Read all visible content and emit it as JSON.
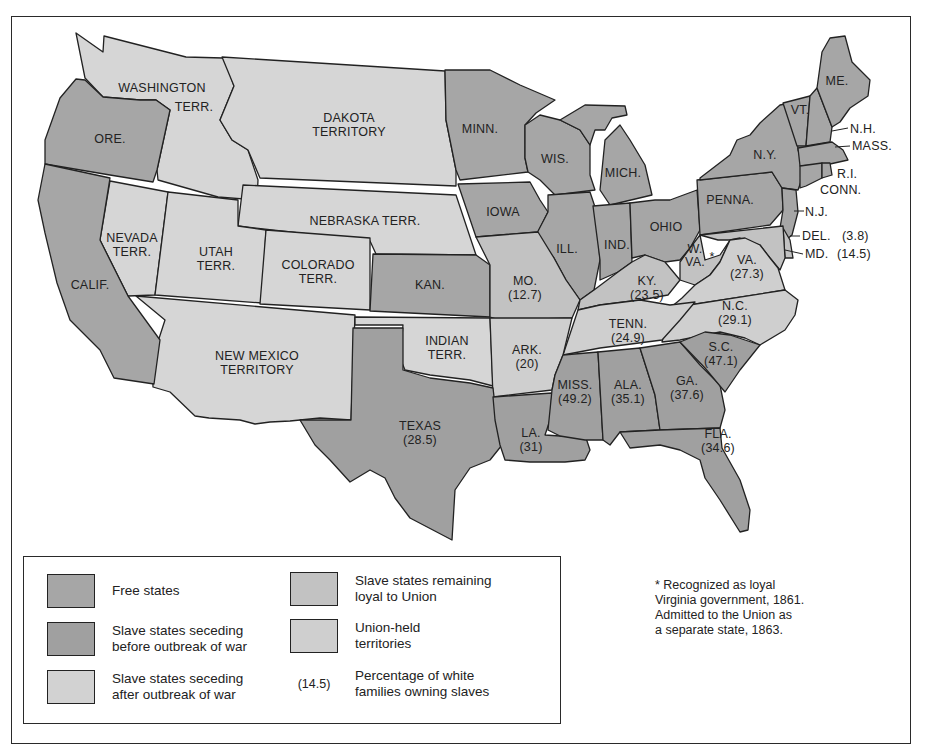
{
  "colors": {
    "free_states": "#a6a6a6",
    "seceding_before": "#a0a0a0",
    "seceding_after": "#cfcfcf",
    "loyal_slave": "#c2c2c2",
    "territories": "#d6d6d6",
    "water": "#ffffff",
    "border": "#222222"
  },
  "map": {
    "regions": [
      {
        "name": "WASHINGTON TERR.",
        "category": "Union-held territories"
      },
      {
        "name": "ORE.",
        "category": "Free states"
      },
      {
        "name": "CALIF.",
        "category": "Free states"
      },
      {
        "name": "NEVADA TERR.",
        "category": "Union-held territories"
      },
      {
        "name": "UTAH TERR.",
        "category": "Union-held territories"
      },
      {
        "name": "COLORADO TERR.",
        "category": "Union-held territories"
      },
      {
        "name": "DAKOTA TERRITORY",
        "category": "Union-held territories"
      },
      {
        "name": "NEBRASKA TERR.",
        "category": "Union-held territories"
      },
      {
        "name": "NEW MEXICO TERRITORY",
        "category": "Union-held territories"
      },
      {
        "name": "INDIAN TERR.",
        "category": "Union-held territories"
      },
      {
        "name": "MINN.",
        "category": "Free states"
      },
      {
        "name": "IOWA",
        "category": "Free states"
      },
      {
        "name": "KAN.",
        "category": "Free states"
      },
      {
        "name": "WIS.",
        "category": "Free states"
      },
      {
        "name": "MICH.",
        "category": "Free states"
      },
      {
        "name": "ILL.",
        "category": "Free states"
      },
      {
        "name": "IND.",
        "category": "Free states"
      },
      {
        "name": "OHIO",
        "category": "Free states"
      },
      {
        "name": "PENNA.",
        "category": "Free states"
      },
      {
        "name": "N.Y.",
        "category": "Free states"
      },
      {
        "name": "VT.",
        "category": "Free states"
      },
      {
        "name": "N.H.",
        "category": "Free states"
      },
      {
        "name": "ME.",
        "category": "Free states"
      },
      {
        "name": "MASS.",
        "category": "Free states"
      },
      {
        "name": "R.I.",
        "category": "Free states"
      },
      {
        "name": "CONN.",
        "category": "Free states"
      },
      {
        "name": "N.J.",
        "category": "Free states"
      },
      {
        "name": "W. VA.",
        "category": "Slave states remaining loyal to Union",
        "footnote": "*"
      },
      {
        "name": "DEL.",
        "pct": "(3.8)",
        "category": "Slave states remaining loyal to Union"
      },
      {
        "name": "MD.",
        "pct": "(14.5)",
        "category": "Slave states remaining loyal to Union"
      },
      {
        "name": "MO.",
        "pct": "(12.7)",
        "category": "Slave states remaining loyal to Union"
      },
      {
        "name": "KY.",
        "pct": "(23.5)",
        "category": "Slave states remaining loyal to Union"
      },
      {
        "name": "VA.",
        "pct": "(27.3)",
        "category": "Slave states seceding after outbreak of war"
      },
      {
        "name": "N.C.",
        "pct": "(29.1)",
        "category": "Slave states seceding after outbreak of war"
      },
      {
        "name": "TENN.",
        "pct": "(24.9)",
        "category": "Slave states seceding after outbreak of war"
      },
      {
        "name": "ARK.",
        "pct": "(20)",
        "category": "Slave states seceding after outbreak of war"
      },
      {
        "name": "S.C.",
        "pct": "(47.1)",
        "category": "Slave states seceding before outbreak of war"
      },
      {
        "name": "GA.",
        "pct": "(37.6)",
        "category": "Slave states seceding before outbreak of war"
      },
      {
        "name": "ALA.",
        "pct": "(35.1)",
        "category": "Slave states seceding before outbreak of war"
      },
      {
        "name": "MISS.",
        "pct": "(49.2)",
        "category": "Slave states seceding before outbreak of war"
      },
      {
        "name": "LA.",
        "pct": "(31)",
        "category": "Slave states seceding before outbreak of war"
      },
      {
        "name": "FLA.",
        "pct": "(34.6)",
        "category": "Slave states seceding before outbreak of war"
      },
      {
        "name": "TEXAS",
        "pct": "(28.5)",
        "category": "Slave states seceding before outbreak of war"
      }
    ],
    "labels": {
      "wash1": "WASHINGTON",
      "wash2": "TERR.",
      "ore": "ORE.",
      "calif": "CALIF.",
      "nev1": "NEVADA",
      "nev2": "TERR.",
      "utah1": "UTAH",
      "utah2": "TERR.",
      "colo1": "COLORADO",
      "colo2": "TERR.",
      "dak1": "DAKOTA",
      "dak2": "TERRITORY",
      "neb": "NEBRASKA TERR.",
      "nm1": "NEW MEXICO",
      "nm2": "TERRITORY",
      "ind1": "INDIAN",
      "ind2": "TERR.",
      "minn": "MINN.",
      "iowa": "IOWA",
      "kan": "KAN.",
      "wis": "WIS.",
      "mich": "MICH.",
      "ill": "ILL.",
      "indiana": "IND.",
      "ohio": "OHIO",
      "penna": "PENNA.",
      "ny": "N.Y.",
      "vt": "VT.",
      "me": "ME.",
      "nh": "N.H.",
      "mass": "MASS.",
      "ri": "R.I.",
      "conn": "CONN.",
      "nj": "N.J.",
      "del": "DEL.",
      "del_pct": "(3.8)",
      "md": "MD.",
      "md_pct": "(14.5)",
      "wva1": "W.",
      "wva2": "VA.",
      "wva_star": "*",
      "va": "VA.",
      "va_pct": "(27.3)",
      "mo": "MO.",
      "mo_pct": "(12.7)",
      "ky": "KY.",
      "ky_pct": "(23.5)",
      "nc": "N.C.",
      "nc_pct": "(29.1)",
      "tenn": "TENN.",
      "tenn_pct": "(24.9)",
      "ark": "ARK.",
      "ark_pct": "(20)",
      "sc": "S.C.",
      "sc_pct": "(47.1)",
      "ga": "GA.",
      "ga_pct": "(37.6)",
      "ala": "ALA.",
      "ala_pct": "(35.1)",
      "miss": "MISS.",
      "miss_pct": "(49.2)",
      "la": "LA.",
      "la_pct": "(31)",
      "fla": "FLA.",
      "fla_pct": "(34.6)",
      "tex": "TEXAS",
      "tex_pct": "(28.5)"
    }
  },
  "legend": {
    "items": [
      {
        "label": "Free states",
        "swatch": "free_states"
      },
      {
        "label": "Slave states seceding\nbefore outbreak of war",
        "swatch": "seceding_before"
      },
      {
        "label": "Slave states seceding\nafter outbreak of war",
        "swatch": "seceding_after"
      },
      {
        "label": "Slave states remaining\nloyal to Union",
        "swatch": "loyal_slave"
      },
      {
        "label": "Union-held\nterritories",
        "swatch": "territories"
      },
      {
        "label": "Percentage of white\nfamilies owning slaves",
        "sample": "(14.5)"
      }
    ]
  },
  "footnote": "* Recognized as loyal\nVirginia government, 1861.\nAdmitted to the Union as\na separate state, 1863."
}
